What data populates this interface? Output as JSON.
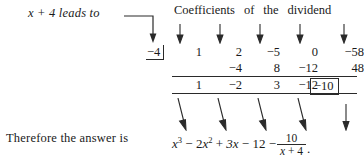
{
  "figure": {
    "type": "synthetic-division",
    "lead_in": "x + 4 leads to",
    "caption_words": [
      "Coefficients",
      "of",
      "the",
      "dividend"
    ],
    "divisor": "−4",
    "row_dividend": [
      "1",
      "2",
      "−5",
      "0",
      "−58"
    ],
    "row_products": [
      "",
      "−4",
      "8",
      "−12",
      "48"
    ],
    "row_results": [
      "1",
      "−2",
      "3",
      "−12"
    ],
    "remainder_boxed": "−10",
    "answer_lead": "Therefore the answer is",
    "answer": {
      "term1_base": "x",
      "term1_exp": "3",
      "op1": "−",
      "term2_coef": "2",
      "term2_base": "x",
      "term2_exp": "2",
      "op2": "+",
      "term3": "3x",
      "op3": "−",
      "term4": "12",
      "op4": "−",
      "fraction_numerator": "10",
      "fraction_denominator_a": "x",
      "fraction_denominator_op": "+",
      "fraction_denominator_b": "4",
      "trailing_period": "."
    }
  },
  "colors": {
    "ink": "#1a1a1a",
    "rule": "#2a2a2a",
    "background": "#ffffff"
  }
}
